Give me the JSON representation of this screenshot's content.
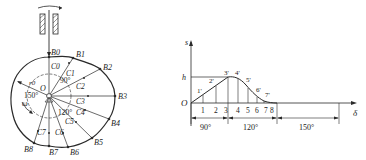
{
  "cam_diagram": {
    "center_label": "O",
    "base_radius_label": "r0",
    "omega_label": "ω",
    "angle_labels": [
      "90°",
      "150°",
      "120°"
    ],
    "b_points": [
      {
        "label": "B0",
        "x": 49,
        "y": 57
      },
      {
        "label": "B1",
        "x": 73,
        "y": 58
      },
      {
        "label": "B2",
        "x": 100,
        "y": 69
      },
      {
        "label": "B3",
        "x": 115,
        "y": 96
      },
      {
        "label": "B4",
        "x": 109,
        "y": 119
      },
      {
        "label": "B5",
        "x": 92,
        "y": 138
      },
      {
        "label": "B6",
        "x": 68,
        "y": 147
      },
      {
        "label": "B7",
        "x": 49,
        "y": 146
      },
      {
        "label": "B8",
        "x": 34,
        "y": 143
      }
    ],
    "c_labels": [
      "C0",
      "C1",
      "C2",
      "C3",
      "C4",
      "C5",
      "C6",
      "C7"
    ]
  },
  "displacement_diagram": {
    "y_axis_label": "s",
    "x_axis_label": "δ",
    "origin_label": "O",
    "h_label": "h",
    "curve_point_labels": [
      "1'",
      "2'",
      "3'",
      "4'",
      "5'",
      "6'",
      "7'"
    ],
    "division_labels": [
      "1",
      "2",
      "3",
      "4",
      "5",
      "6",
      "7",
      "8"
    ],
    "segments": [
      {
        "label": "90°",
        "phase": "rise"
      },
      {
        "label": "120°",
        "phase": "return"
      },
      {
        "label": "150°",
        "phase": "dwell"
      }
    ]
  }
}
